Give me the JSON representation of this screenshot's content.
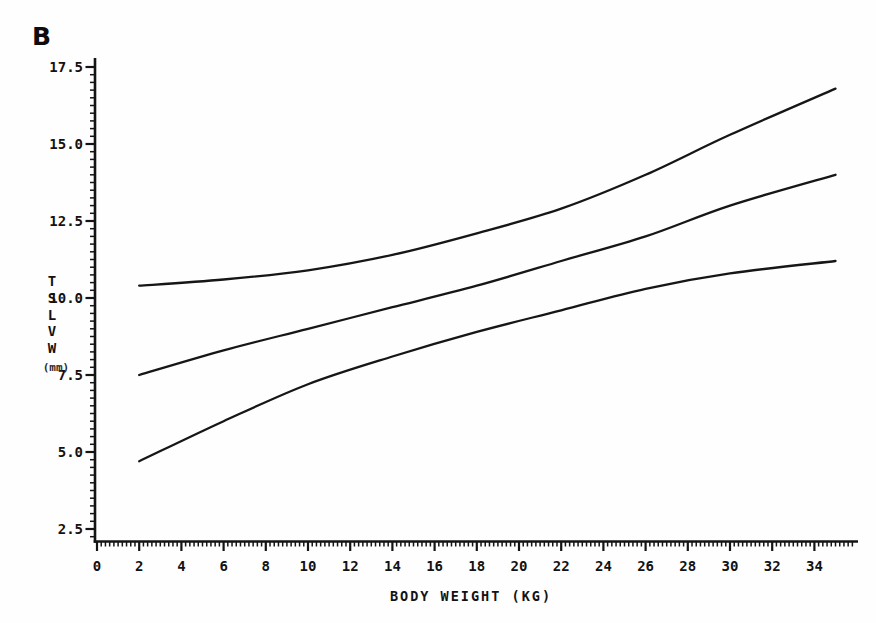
{
  "panel_label": "B",
  "colors": {
    "ink": "#141414",
    "curve": "#161616",
    "background": "#fefefe"
  },
  "chart_data": {
    "type": "line",
    "title": "",
    "xlabel": "BODY WEIGHT (KG)",
    "ylabel": "TSLVW",
    "ylabel_unit": "(mm)",
    "grid": false,
    "legend": null,
    "x_axis": {
      "min": 0,
      "max": 36.1,
      "major_ticks": [
        0,
        2,
        4,
        6,
        8,
        10,
        12,
        14,
        16,
        18,
        20,
        22,
        24,
        26,
        28,
        30,
        32,
        34
      ],
      "major_tick_labels": [
        "0",
        "2",
        "4",
        "6",
        "8",
        "10",
        "12",
        "14",
        "16",
        "18",
        "20",
        "22",
        "24",
        "26",
        "28",
        "30",
        "32",
        "34"
      ],
      "minor_step": 0.2,
      "minor_range": [
        0,
        35.8
      ]
    },
    "y_axis": {
      "min": 2.1,
      "max": 17.9,
      "major_ticks": [
        2.5,
        5.0,
        7.5,
        10.0,
        12.5,
        15.0,
        17.5
      ],
      "major_tick_labels": [
        "2.5",
        "5.0",
        "7.5",
        "10.0",
        "12.5",
        "15.0",
        "17.5"
      ],
      "minor_step": 0.25,
      "minor_range": [
        2.25,
        17.5
      ]
    },
    "x": [
      2,
      6,
      10,
      14,
      18,
      22,
      26,
      30,
      35
    ],
    "series": [
      {
        "name": "upper-confidence-curve",
        "values": [
          10.4,
          10.6,
          10.9,
          11.4,
          12.1,
          12.9,
          14.0,
          15.3,
          16.8
        ]
      },
      {
        "name": "mean-regression-curve",
        "values": [
          7.5,
          8.3,
          9.0,
          9.7,
          10.4,
          11.2,
          12.0,
          13.0,
          14.0
        ]
      },
      {
        "name": "lower-confidence-curve",
        "values": [
          4.7,
          6.0,
          7.2,
          8.1,
          8.9,
          9.6,
          10.3,
          10.8,
          11.2
        ]
      }
    ]
  }
}
